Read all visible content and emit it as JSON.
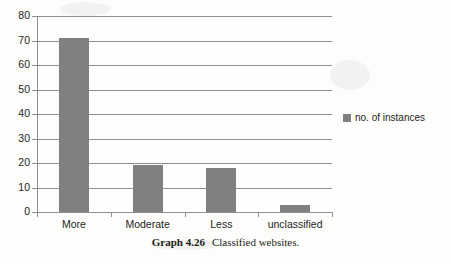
{
  "chart_data": {
    "type": "bar",
    "title": "",
    "xlabel": "",
    "ylabel": "",
    "categories": [
      "More",
      "Moderate",
      "Less",
      "unclassified"
    ],
    "values": [
      71,
      19,
      18,
      3
    ],
    "series": [
      {
        "name": "no. of instances",
        "values": [
          71,
          19,
          18,
          3
        ]
      }
    ],
    "ylim": [
      0,
      80
    ],
    "ytick_step": 10,
    "yticks": [
      80,
      70,
      60,
      50,
      40,
      30,
      20,
      10,
      0
    ],
    "ytick_labels": [
      "80",
      "70",
      "60",
      "50",
      "40",
      "30",
      "20",
      "10",
      "0"
    ],
    "grid": true,
    "legend_position": "right",
    "bar_color": "#808080",
    "axis_color": "#8e8e8e"
  },
  "legend": {
    "swatch_name": "legend-color-swatch",
    "entries": [
      {
        "label": "no. of instances",
        "color": "#808080"
      }
    ]
  },
  "caption": {
    "number": "Graph 4.26",
    "text": "Classified websites."
  }
}
